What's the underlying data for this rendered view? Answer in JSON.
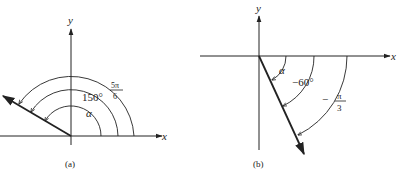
{
  "panels": [
    {
      "caption": "(a)",
      "axes": {
        "x_label": "x",
        "y_label": "y"
      },
      "terminal_ray_angle": "150°",
      "angle_labels": {
        "alpha": "α",
        "degrees": "150°",
        "radians_num": "5π",
        "radians_den": "6"
      }
    },
    {
      "caption": "(b)",
      "axes": {
        "x_label": "x",
        "y_label": "y"
      },
      "terminal_ray_angle": "-60°",
      "angle_labels": {
        "alpha": "α",
        "degrees": "−60°",
        "radians_sign": "−",
        "radians_num": "π",
        "radians_den": "3"
      }
    }
  ],
  "colors": {
    "ink": "#222222",
    "background": "#ffffff"
  }
}
